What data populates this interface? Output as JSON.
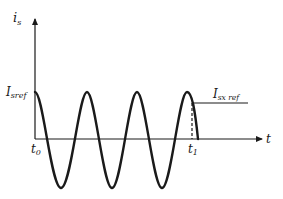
{
  "diagram": {
    "type": "waveform",
    "y_axis": {
      "label_main": "i",
      "label_sub": "s"
    },
    "x_axis": {
      "label": "t"
    },
    "levels": {
      "i_sref": {
        "label_main": "I",
        "label_sub": "sref"
      },
      "i_sx_ref": {
        "label_main": "I",
        "label_sub": "sx ref"
      }
    },
    "time_marks": {
      "t0": {
        "label_main": "t",
        "label_sub": "0"
      },
      "t1": {
        "label_main": "t",
        "label_sub": "1"
      }
    },
    "waveform": {
      "cycles_shown": 3.2,
      "start_phase": "peak",
      "peaks_count": 4,
      "troughs_count": 3
    },
    "colors": {
      "stroke": "#1a1a1a",
      "background": "#ffffff"
    }
  }
}
